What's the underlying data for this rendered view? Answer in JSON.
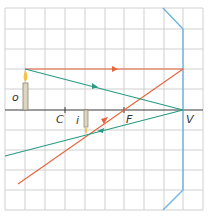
{
  "diagram": {
    "colors": {
      "grid": "#c8c8c8",
      "axis": "#333333",
      "mirror": "#6fb3e0",
      "ray_parallel": "#e8643c",
      "ray_vertex": "#2a9a82",
      "object": "#d8d2bc"
    },
    "labels": {
      "object": "o",
      "image": "i",
      "center": "C",
      "focus": "F",
      "vertex": "V"
    },
    "points": {
      "C": [
        65,
        110
      ],
      "F": [
        124,
        110
      ],
      "V": [
        183,
        110
      ],
      "object_base": [
        25,
        110
      ],
      "object_tip": [
        25,
        69
      ],
      "image_base": [
        86,
        110
      ],
      "image_tip": [
        86,
        130
      ]
    }
  }
}
